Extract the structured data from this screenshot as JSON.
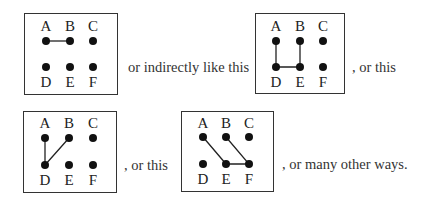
{
  "labels": {
    "top": [
      "A",
      "B",
      "C"
    ],
    "bottom": [
      "D",
      "E",
      "F"
    ]
  },
  "captions": [
    "or indirectly like this",
    ", or this",
    ", or this",
    ", or many other ways."
  ],
  "diagrams": [
    {
      "id": "diagram-1",
      "connections": [
        [
          "A",
          "B"
        ]
      ]
    },
    {
      "id": "diagram-2",
      "connections": [
        [
          "A",
          "D"
        ],
        [
          "D",
          "E"
        ],
        [
          "E",
          "B"
        ]
      ]
    },
    {
      "id": "diagram-3",
      "connections": [
        [
          "A",
          "D"
        ],
        [
          "D",
          "B"
        ]
      ]
    },
    {
      "id": "diagram-4",
      "connections": [
        [
          "A",
          "E"
        ],
        [
          "E",
          "F"
        ],
        [
          "F",
          "B"
        ]
      ]
    }
  ]
}
